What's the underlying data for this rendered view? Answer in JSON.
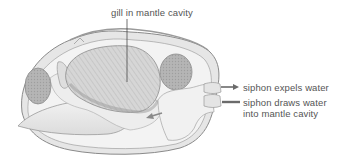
{
  "diagram": {
    "labels": {
      "gill": "gill in mantle cavity",
      "siphon_expels": "siphon expels water",
      "siphon_draws": "siphon draws water into mantle cavity"
    },
    "colors": {
      "shell_outline": "#8a8a8a",
      "body_fill": "#ececec",
      "gill_fill": "#d4d4d4",
      "muscle_fill": "#b8b8b8",
      "arrow": "#6b6b6b",
      "label_text": "#555555"
    }
  }
}
